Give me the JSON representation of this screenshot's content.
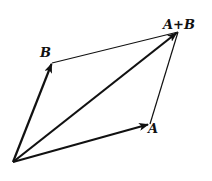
{
  "diagram": {
    "points": {
      "origin": [
        13,
        162
      ],
      "A": [
        150,
        124
      ],
      "B": [
        52,
        63
      ],
      "sum": [
        178,
        32
      ]
    },
    "labels": {
      "A": "A",
      "B": "B",
      "sum": "A+B"
    },
    "colors": {
      "stroke": "#111111",
      "background": "#ffffff"
    }
  }
}
